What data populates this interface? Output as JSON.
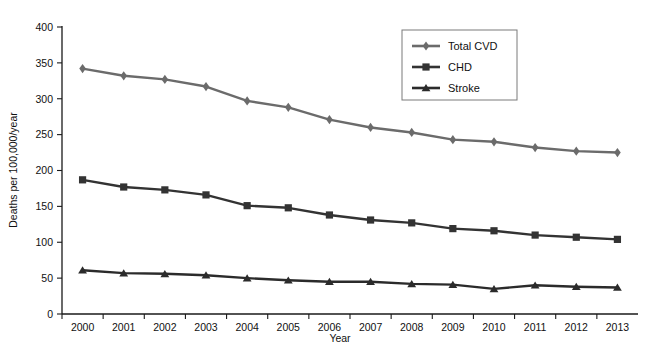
{
  "chart_data": {
    "type": "line",
    "title": "",
    "xlabel": "Year",
    "ylabel": "Deaths per 100,000/year",
    "categories": [
      "2000",
      "2001",
      "2002",
      "2003",
      "2004",
      "2005",
      "2006",
      "2007",
      "2008",
      "2009",
      "2010",
      "2011",
      "2012",
      "2013"
    ],
    "x": [
      2000,
      2001,
      2002,
      2003,
      2004,
      2005,
      2006,
      2007,
      2008,
      2009,
      2010,
      2011,
      2012,
      2013
    ],
    "ylim": [
      0,
      400
    ],
    "yticks": [
      0,
      50,
      100,
      150,
      200,
      250,
      300,
      350,
      400
    ],
    "ytick_labels": [
      "0",
      "50",
      "100",
      "150",
      "200",
      "250",
      "300",
      "350",
      "400"
    ],
    "grid": false,
    "legend_position": "top-right",
    "series": [
      {
        "name": "Total CVD",
        "marker": "diamond",
        "color": "#6b6b6b",
        "values": [
          342,
          332,
          327,
          317,
          297,
          288,
          271,
          260,
          253,
          243,
          240,
          232,
          227,
          225
        ]
      },
      {
        "name": "CHD",
        "marker": "square",
        "color": "#333333",
        "values": [
          187,
          177,
          173,
          166,
          151,
          148,
          138,
          131,
          127,
          119,
          116,
          110,
          107,
          104
        ]
      },
      {
        "name": "Stroke",
        "marker": "triangle",
        "color": "#2b2b2b",
        "values": [
          61,
          57,
          56,
          54,
          50,
          47,
          45,
          45,
          42,
          41,
          35,
          40,
          38,
          37
        ]
      }
    ]
  },
  "colors": {
    "axis": "#1a1a1a",
    "background": "#ffffff",
    "legend_border": "#7a7a7a",
    "total_cvd": "#6b6b6b",
    "chd": "#333333",
    "stroke": "#2b2b2b"
  }
}
